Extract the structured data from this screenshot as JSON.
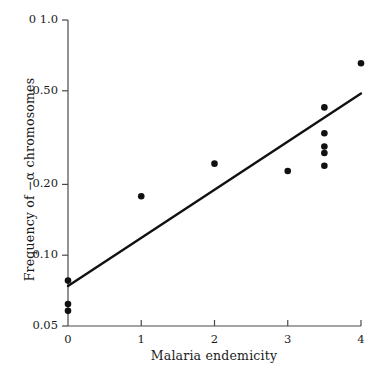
{
  "chart_data": {
    "type": "scatter",
    "title": "",
    "xlabel": "Malaria endemicity",
    "ylabel": "Frequency of −α chromosomes",
    "yscale": "log",
    "xlim": [
      0,
      4
    ],
    "ylim": [
      0.05,
      1.0
    ],
    "grid": false,
    "legend": null,
    "xticks": [
      {
        "value": 0,
        "label": "0"
      },
      {
        "value": 1,
        "label": "1"
      },
      {
        "value": 2,
        "label": "2"
      },
      {
        "value": 3,
        "label": "3"
      },
      {
        "value": 4,
        "label": "4"
      }
    ],
    "yticks": [
      {
        "value": 1.0,
        "label": "0 1.0"
      },
      {
        "value": 0.5,
        "label": "0.50"
      },
      {
        "value": 0.2,
        "label": "0.20"
      },
      {
        "value": 0.1,
        "label": "0.10"
      },
      {
        "value": 0.05,
        "label": "0.05"
      }
    ],
    "points": [
      {
        "x": 0,
        "y": 0.078
      },
      {
        "x": 0,
        "y": 0.062
      },
      {
        "x": 0,
        "y": 0.058
      },
      {
        "x": 1,
        "y": 0.178
      },
      {
        "x": 2,
        "y": 0.245
      },
      {
        "x": 3,
        "y": 0.228
      },
      {
        "x": 3.5,
        "y": 0.425
      },
      {
        "x": 3.5,
        "y": 0.33
      },
      {
        "x": 3.5,
        "y": 0.29
      },
      {
        "x": 3.5,
        "y": 0.272
      },
      {
        "x": 3.5,
        "y": 0.24
      },
      {
        "x": 4,
        "y": 0.655
      }
    ],
    "fit_line": {
      "label": "regression line",
      "x_start": 0,
      "y_start": 0.074,
      "x_end": 4,
      "y_end": 0.487
    },
    "marker": {
      "shape": "circle",
      "color": "#111111",
      "size": 4.6
    },
    "line_color": "#111111",
    "axis_color": "#4a4a4a"
  }
}
